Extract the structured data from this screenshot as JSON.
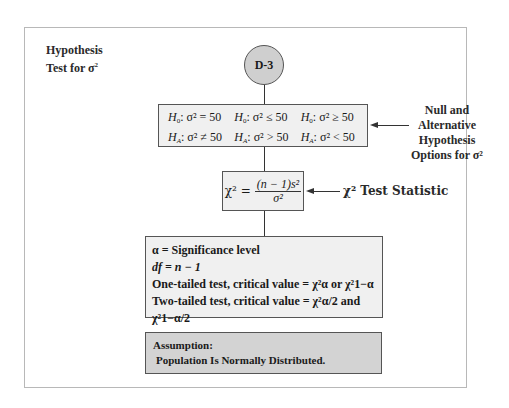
{
  "diagram": {
    "title_line1": "Hypothesis",
    "title_line2": "Test for σ",
    "title_sup": "2",
    "node_label": "D-3",
    "hypotheses": [
      {
        "h0": "σ² = 50",
        "ha": "σ² ≠ 50"
      },
      {
        "h0": "σ² ≤ 50",
        "ha": "σ² > 50"
      },
      {
        "h0": "σ² ≥ 50",
        "ha": "σ² < 50"
      }
    ],
    "h0_label": "H",
    "h0_sub": "0",
    "ha_label": "H",
    "ha_sub": "A",
    "hypothesis_annotation": [
      "Null and",
      "Alternative",
      "Hypothesis",
      "Options for σ²"
    ],
    "formula": {
      "lhs": "χ² =",
      "numerator": "(n − 1)s²",
      "denominator": "σ²"
    },
    "formula_annotation": "χ² Test Statistic",
    "details": {
      "alpha": "α = Significance level",
      "df": "df = n − 1",
      "one_tailed": "One-tailed test, critical value = χ²α or χ²1−α",
      "two_tailed": "Two-tailed test, critical value = χ²α/2 and χ²1−α/2"
    },
    "assumption_title": "Assumption:",
    "assumption_text": "Population Is Normally Distributed."
  }
}
